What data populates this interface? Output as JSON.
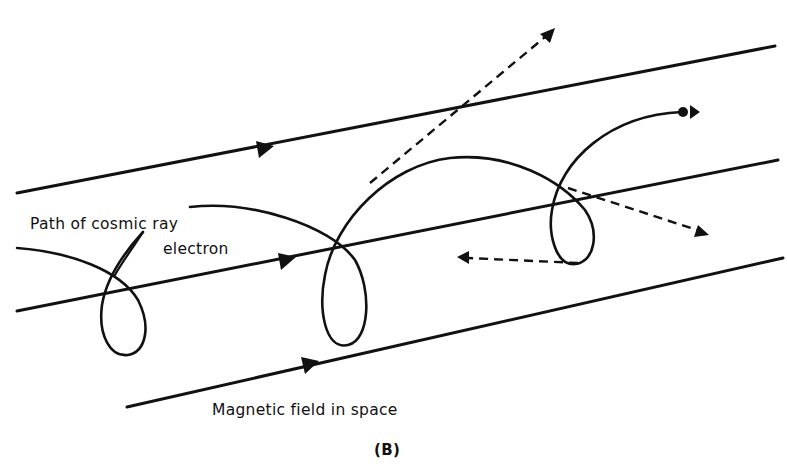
{
  "figure": {
    "labels": {
      "electron_path": "Path of cosmic ray",
      "electron_path_line2": "electron",
      "field": "Magnetic field in space"
    },
    "caption": "(B)",
    "elements": {
      "field_lines": 3,
      "field_direction": "left-to-right (arrowheads)",
      "electron_loops": 3,
      "scattered_photons": 3
    }
  }
}
